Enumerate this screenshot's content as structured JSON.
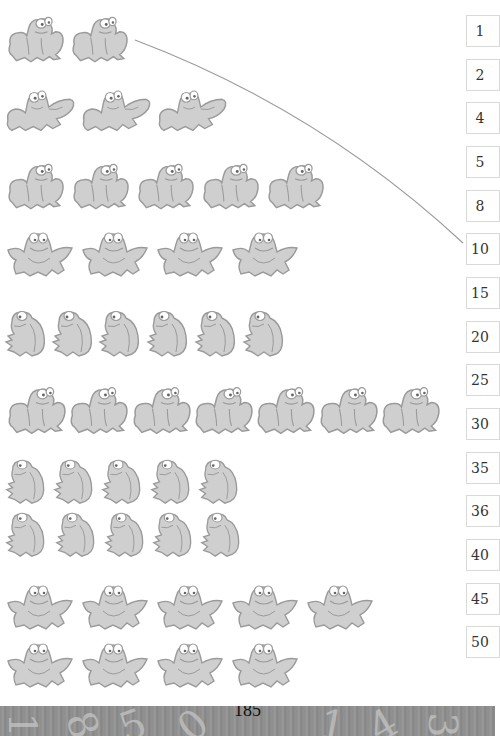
{
  "worksheet": {
    "frog_groups": [
      {
        "id": "group-1",
        "count": 2,
        "frog_type": "sitting",
        "rows": [
          2
        ]
      },
      {
        "id": "group-2",
        "count": 3,
        "frog_type": "leaping",
        "rows": [
          3
        ]
      },
      {
        "id": "group-3",
        "count": 5,
        "frog_type": "sitting",
        "rows": [
          5
        ]
      },
      {
        "id": "group-4",
        "count": 4,
        "frog_type": "smiling",
        "rows": [
          4
        ]
      },
      {
        "id": "group-5",
        "count": 6,
        "frog_type": "side",
        "rows": [
          6
        ]
      },
      {
        "id": "group-6",
        "count": 7,
        "frog_type": "sitting",
        "rows": [
          7
        ]
      },
      {
        "id": "group-7",
        "count": 10,
        "frog_type": "side",
        "rows": [
          5,
          5
        ]
      },
      {
        "id": "group-8",
        "count": 9,
        "frog_type": "smiling",
        "rows": [
          5,
          4
        ]
      }
    ],
    "answer_options": [
      "1",
      "2",
      "4",
      "5",
      "8",
      "10",
      "15",
      "20",
      "25",
      "30",
      "35",
      "36",
      "40",
      "45",
      "50"
    ],
    "example_match": {
      "group": "group-1",
      "answer": "10"
    },
    "colors": {
      "frog_fill": "#cfcfcf",
      "frog_stroke": "#9a9a9a",
      "line": "#9b9b9b",
      "box_border": "#d9d9d9",
      "footer": "#8f8f8f"
    }
  },
  "footer": {
    "page_number": "185",
    "decorative_digits": [
      "1",
      "8",
      "5",
      "0",
      "1",
      "4",
      "3"
    ]
  }
}
